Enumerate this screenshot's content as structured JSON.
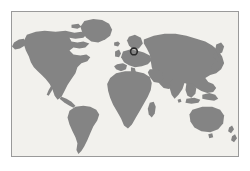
{
  "document": {
    "type": "world-map-figure",
    "title": "World map",
    "background_color": "#ffffff"
  },
  "map": {
    "frame": {
      "border_color": "#9a9a9a",
      "border_width_px": 1,
      "x": 11,
      "y": 11,
      "width": 228,
      "height": 146
    },
    "ocean_color": "#f2f1ed",
    "land_color": "#848484",
    "projection_note": "equirectangular-style world outline, Antarctica omitted",
    "landmasses": [
      {
        "name": "north-america"
      },
      {
        "name": "greenland"
      },
      {
        "name": "south-america"
      },
      {
        "name": "europe"
      },
      {
        "name": "british-isles"
      },
      {
        "name": "scandinavia"
      },
      {
        "name": "africa"
      },
      {
        "name": "madagascar"
      },
      {
        "name": "asia"
      },
      {
        "name": "india"
      },
      {
        "name": "japan"
      },
      {
        "name": "indonesia"
      },
      {
        "name": "new-guinea"
      },
      {
        "name": "australia"
      },
      {
        "name": "new-zealand"
      }
    ]
  },
  "marker": {
    "label": "location-marker",
    "shape": "ring",
    "color": "#2b2b2b",
    "x": 134,
    "y": 51,
    "radius_px": 3.4,
    "region_indicated": "eastern-europe-western-russia"
  },
  "labels": {
    "has_text_labels": false,
    "has_legend": false,
    "has_graticule": false
  }
}
